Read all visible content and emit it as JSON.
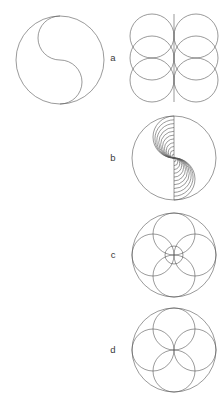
{
  "page": {
    "background_color": "#ffffff",
    "stroke_color": "#555555",
    "label_color": "#3a3a3a",
    "stroke_width": 0.6,
    "width": 222,
    "height": 398
  },
  "main_figure": {
    "name": "s-curve-circle",
    "description": "Outer circle divided by an S-shaped curve made of two semicircular arcs",
    "center_x": 60,
    "center_y": 60,
    "radius": 44,
    "inner_radius": 22
  },
  "figures": [
    {
      "id": "a",
      "label": "a",
      "label_x": 113,
      "label_y": 58,
      "type": "circle-grid",
      "center_x": 174,
      "center_y": 58,
      "columns": 2,
      "rows": 3,
      "circle_radius": 22,
      "column_offset": 22,
      "row_spacing": 22,
      "axis_line": true,
      "axis_label": "vertical-center-line",
      "description": "Six overlapping circles in two columns of three with a vertical centre line"
    },
    {
      "id": "b",
      "label": "b",
      "label_x": 113,
      "label_y": 158,
      "type": "nested-spiral",
      "center_x": 174,
      "center_y": 158,
      "radius": 42,
      "turns": 11,
      "axis_line": true,
      "description": "Nested S-curves forming a double spiral inside a circle with a vertical centre line"
    },
    {
      "id": "c",
      "label": "c",
      "label_x": 113,
      "label_y": 255,
      "type": "rosette-offset",
      "center_x": 174,
      "center_y": 255,
      "radius": 42,
      "petal_count": 4,
      "petal_radius": 21,
      "petal_distance": 21,
      "inner_circle_radius": 9,
      "description": "Outer circle containing four offset circles forming a rosette with a small centre circle"
    },
    {
      "id": "d",
      "label": "d",
      "label_x": 113,
      "label_y": 350,
      "type": "rosette-centered",
      "center_x": 174,
      "center_y": 350,
      "radius": 42,
      "petal_count": 4,
      "petal_radius": 21,
      "petal_distance": 21,
      "description": "Outer circle containing four circles of half radius meeting at the centre"
    }
  ]
}
